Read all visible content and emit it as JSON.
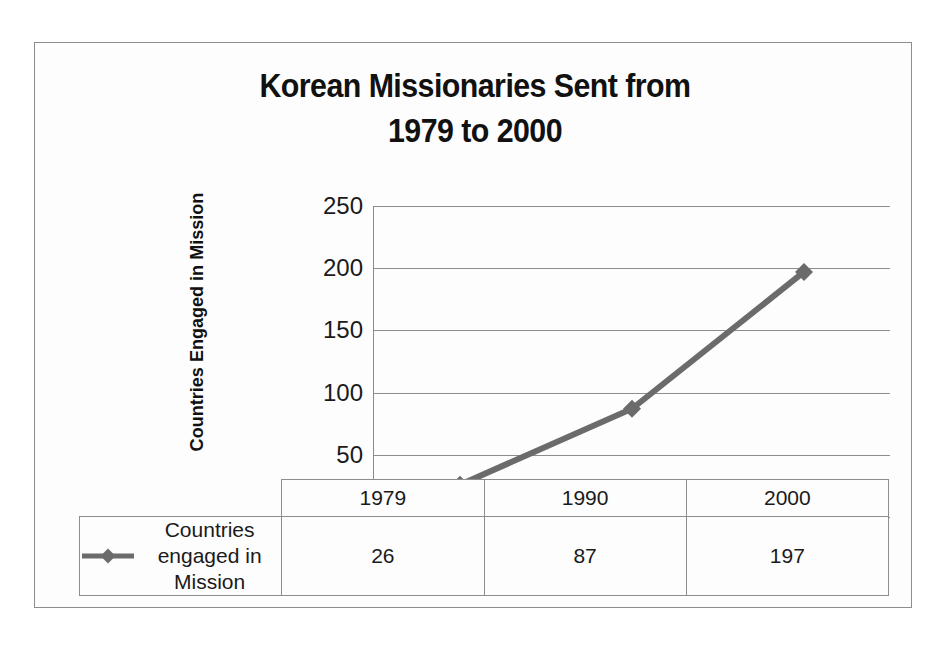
{
  "chart_data": {
    "type": "line",
    "title": "Korean Missionaries Sent from 1979 to 2000",
    "title_lines": [
      "Korean Missionaries Sent from",
      "1979 to 2000"
    ],
    "xlabel": "",
    "ylabel": "Countries Engaged in Mission",
    "categories": [
      "1979",
      "1990",
      "2000"
    ],
    "series": [
      {
        "name": "Countries engaged in Mission",
        "values": [
          26,
          87,
          197
        ],
        "color": "#6b6b6b",
        "marker": "diamond"
      }
    ],
    "ylim": [
      0,
      250
    ],
    "ytick_values": [
      250,
      200,
      150,
      100,
      50,
      0
    ],
    "ytick_labels": [
      "250",
      "200",
      "150",
      "100",
      "50",
      "0"
    ],
    "grid": true,
    "legend_position": "bottom-left-table",
    "data_table": {
      "legend_label_lines": [
        "Countries engaged in",
        "Mission"
      ],
      "legend_label": "Countries engaged in Mission",
      "columns": [
        "1979",
        "1990",
        "2000"
      ],
      "row_values": [
        "26",
        "87",
        "197"
      ]
    }
  },
  "colors": {
    "series_line": "#6b6b6b",
    "gridline": "#8d8d8d",
    "frame": "#8d8d8d",
    "text": "#161616",
    "background": "#fdfdfd"
  }
}
